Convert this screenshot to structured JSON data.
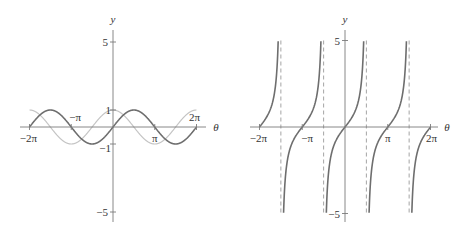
{
  "chart_data": [
    {
      "type": "line",
      "title": "",
      "xlabel": "θ",
      "ylabel": "y",
      "xlim": [
        -6.2832,
        6.2832
      ],
      "ylim": [
        -5,
        5
      ],
      "grid": false,
      "legend": null,
      "x_ticks": [
        {
          "value": -6.2832,
          "label": "−2π"
        },
        {
          "value": -3.1416,
          "label": "−π"
        },
        {
          "value": 3.1416,
          "label": "π"
        },
        {
          "value": 6.2832,
          "label": "2π"
        }
      ],
      "y_ticks": [
        {
          "value": 5,
          "label": "5"
        },
        {
          "value": 1,
          "label": "1"
        },
        {
          "value": -1,
          "label": "−1"
        },
        {
          "value": -5,
          "label": "−5"
        }
      ],
      "series": [
        {
          "name": "sin θ",
          "style": "dark",
          "color": "#6e6e6e",
          "function": "sin",
          "x": [
            -6.2832,
            -4.7124,
            -3.1416,
            -1.5708,
            0,
            1.5708,
            3.1416,
            4.7124,
            6.2832
          ],
          "values": [
            0,
            1,
            0,
            -1,
            0,
            1,
            0,
            -1,
            0
          ]
        },
        {
          "name": "cos θ",
          "style": "light",
          "color": "#c4c4c4",
          "function": "cos",
          "x": [
            -6.2832,
            -4.7124,
            -3.1416,
            -1.5708,
            0,
            1.5708,
            3.1416,
            4.7124,
            6.2832
          ],
          "values": [
            1,
            0,
            -1,
            0,
            1,
            0,
            -1,
            0,
            1
          ]
        }
      ]
    },
    {
      "type": "line",
      "title": "",
      "xlabel": "θ",
      "ylabel": "y",
      "xlim": [
        -6.2832,
        6.2832
      ],
      "ylim": [
        -5,
        5
      ],
      "grid": false,
      "legend": null,
      "x_ticks": [
        {
          "value": -6.2832,
          "label": "−2π"
        },
        {
          "value": -3.1416,
          "label": "−π"
        },
        {
          "value": 3.1416,
          "label": "π"
        },
        {
          "value": 6.2832,
          "label": "2π"
        }
      ],
      "y_ticks": [
        {
          "value": 5,
          "label": "5"
        },
        {
          "value": -5,
          "label": "−5"
        }
      ],
      "asymptotes": [
        -4.7124,
        -1.5708,
        1.5708,
        4.7124
      ],
      "series": [
        {
          "name": "tan θ",
          "style": "dark",
          "color": "#6e6e6e",
          "function": "tan",
          "x": [
            -6.2832,
            -5.4978,
            -3.927,
            -3.1416,
            -2.3562,
            -0.7854,
            0,
            0.7854,
            2.3562,
            3.1416,
            3.927,
            5.4978,
            6.2832
          ],
          "values": [
            0,
            1,
            -1,
            0,
            1,
            -1,
            0,
            1,
            -1,
            0,
            1,
            -1,
            0
          ]
        }
      ]
    }
  ],
  "colors": {
    "axis": "#7a7a7a",
    "dark_curve": "#6e6e6e",
    "light_curve": "#c4c4c4",
    "asymptote": "#9a9a9a",
    "text": "#333333"
  }
}
